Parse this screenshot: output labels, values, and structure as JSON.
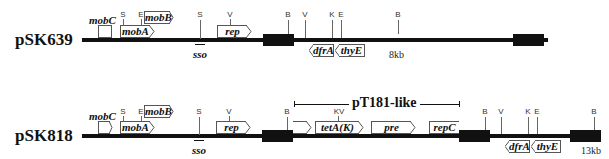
{
  "figure": {
    "plasmids": [
      {
        "name": "pSK639",
        "size_label": "8kb",
        "genes": [
          {
            "name": "mobC",
            "orientation": "right"
          },
          {
            "name": "mobA",
            "orientation": "right"
          },
          {
            "name": "mobB",
            "orientation": "right"
          },
          {
            "name": "rep",
            "orientation": "right"
          },
          {
            "name": "dfrA",
            "orientation": "left"
          },
          {
            "name": "thyE",
            "orientation": "left"
          }
        ],
        "sites": [
          "S",
          "E",
          "S",
          "V",
          "B",
          "V",
          "K",
          "E",
          "B"
        ],
        "origin_label": "sso"
      },
      {
        "name": "pSK818",
        "size_label": "13kb",
        "region_label": "pT181-like",
        "genes": [
          {
            "name": "mobC",
            "orientation": "right"
          },
          {
            "name": "mobA",
            "orientation": "right"
          },
          {
            "name": "mobB",
            "orientation": "right"
          },
          {
            "name": "rep",
            "orientation": "right"
          },
          {
            "name": "",
            "orientation": "right"
          },
          {
            "name": "tetA(K)",
            "orientation": "right"
          },
          {
            "name": "pre",
            "orientation": "right"
          },
          {
            "name": "repC",
            "orientation": "right"
          },
          {
            "name": "dfrA",
            "orientation": "left"
          },
          {
            "name": "thyE",
            "orientation": "left"
          }
        ],
        "sites": [
          "S",
          "E",
          "S",
          "V",
          "B",
          "K",
          "V",
          "B",
          "V",
          "K",
          "E",
          "B"
        ],
        "origin_label": "sso"
      }
    ],
    "site_legend": {
      "S": "S",
      "E": "E",
      "V": "V",
      "B": "B",
      "K": "K"
    }
  }
}
